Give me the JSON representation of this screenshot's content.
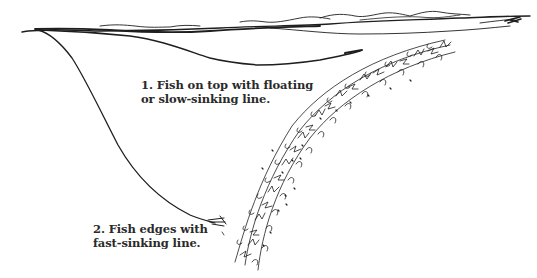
{
  "diagram": {
    "captions": [
      {
        "id": "caption-1",
        "lines": [
          "1.  Fish on top with floating",
          "or slow-sinking line."
        ]
      },
      {
        "id": "caption-2",
        "lines": [
          "2.  Fish edges with",
          "fast-sinking line."
        ]
      }
    ],
    "elements": {
      "water_surface": "wavy surface line across top",
      "line_1": "floating / slow-sinking fly line curving shallow under surface",
      "line_2": "fast-sinking fly line dropping deep toward weed edge",
      "weed_bed": "arched band of aquatic weeds rising from bottom to near surface"
    },
    "colors": {
      "ink": "#1e1e1e",
      "background": "#ffffff"
    }
  }
}
